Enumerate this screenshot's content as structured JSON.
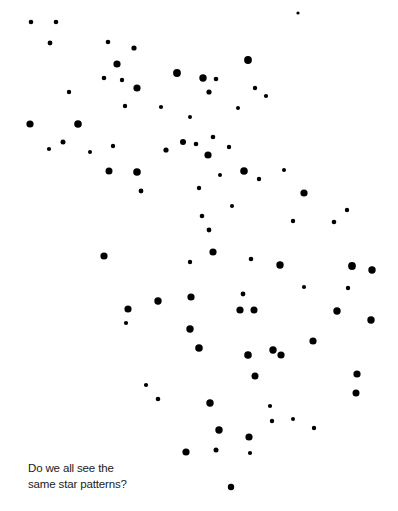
{
  "figure": {
    "background_color": "#ffffff",
    "star_color": "#000000",
    "width": 398,
    "height": 511
  },
  "caption": {
    "text": "Do we all see the\nsame star patterns?",
    "color": "#1b1b1b",
    "line1": "Do we all see the",
    "line2": "same star patterns?"
  },
  "chart_data": {
    "type": "scatter",
    "title": "",
    "subtitle": "",
    "xlabel": "",
    "ylabel": "",
    "annotations": [
      "Do we all see the same star patterns?"
    ],
    "grid": false,
    "legend": null,
    "axis_visible": false,
    "xlim": [
      0,
      398
    ],
    "ylim": [
      0,
      511
    ],
    "marker_color": "#000000",
    "marker_shape": "circle",
    "point_count": 88,
    "size_units": "radius_px",
    "points": [
      {
        "x": 31,
        "y": 22,
        "r": 2.3
      },
      {
        "x": 56,
        "y": 22,
        "r": 2.3
      },
      {
        "x": 50,
        "y": 43,
        "r": 2.4
      },
      {
        "x": 298,
        "y": 13,
        "r": 1.6
      },
      {
        "x": 108,
        "y": 42,
        "r": 2.3
      },
      {
        "x": 134,
        "y": 48,
        "r": 2.6
      },
      {
        "x": 117,
        "y": 64,
        "r": 3.6
      },
      {
        "x": 177,
        "y": 73,
        "r": 3.9
      },
      {
        "x": 104,
        "y": 78,
        "r": 2.3
      },
      {
        "x": 122,
        "y": 80,
        "r": 2.2
      },
      {
        "x": 137,
        "y": 88,
        "r": 3.6
      },
      {
        "x": 125,
        "y": 106,
        "r": 2.2
      },
      {
        "x": 248,
        "y": 60,
        "r": 3.9
      },
      {
        "x": 203,
        "y": 78,
        "r": 3.7
      },
      {
        "x": 216,
        "y": 79,
        "r": 2.3
      },
      {
        "x": 209,
        "y": 92,
        "r": 2.6
      },
      {
        "x": 255,
        "y": 88,
        "r": 2.2
      },
      {
        "x": 266,
        "y": 96,
        "r": 2.1
      },
      {
        "x": 69,
        "y": 92,
        "r": 2.2
      },
      {
        "x": 78,
        "y": 124,
        "r": 3.8
      },
      {
        "x": 30,
        "y": 124,
        "r": 3.6
      },
      {
        "x": 49,
        "y": 149,
        "r": 2.1
      },
      {
        "x": 63,
        "y": 142,
        "r": 2.5
      },
      {
        "x": 113,
        "y": 146,
        "r": 2.2
      },
      {
        "x": 109,
        "y": 171,
        "r": 3.5
      },
      {
        "x": 137,
        "y": 172,
        "r": 3.8
      },
      {
        "x": 141,
        "y": 191,
        "r": 2.4
      },
      {
        "x": 166,
        "y": 150,
        "r": 2.6
      },
      {
        "x": 183,
        "y": 142,
        "r": 3.0
      },
      {
        "x": 196,
        "y": 144,
        "r": 2.3
      },
      {
        "x": 208,
        "y": 155,
        "r": 3.6
      },
      {
        "x": 213,
        "y": 137,
        "r": 2.3
      },
      {
        "x": 229,
        "y": 147,
        "r": 2.2
      },
      {
        "x": 199,
        "y": 188,
        "r": 2.2
      },
      {
        "x": 220,
        "y": 175,
        "r": 2.0
      },
      {
        "x": 244,
        "y": 171,
        "r": 3.8
      },
      {
        "x": 259,
        "y": 179,
        "r": 2.2
      },
      {
        "x": 284,
        "y": 170,
        "r": 2.0
      },
      {
        "x": 304,
        "y": 193,
        "r": 3.6
      },
      {
        "x": 347,
        "y": 210,
        "r": 2.2
      },
      {
        "x": 293,
        "y": 221,
        "r": 2.2
      },
      {
        "x": 334,
        "y": 222,
        "r": 2.3
      },
      {
        "x": 202,
        "y": 216,
        "r": 2.3
      },
      {
        "x": 209,
        "y": 230,
        "r": 2.4
      },
      {
        "x": 213,
        "y": 252,
        "r": 3.6
      },
      {
        "x": 190,
        "y": 262,
        "r": 2.2
      },
      {
        "x": 251,
        "y": 259,
        "r": 2.3
      },
      {
        "x": 104,
        "y": 256,
        "r": 3.6
      },
      {
        "x": 280,
        "y": 265,
        "r": 3.7
      },
      {
        "x": 352,
        "y": 266,
        "r": 3.9
      },
      {
        "x": 372,
        "y": 270,
        "r": 3.7
      },
      {
        "x": 304,
        "y": 287,
        "r": 2.1
      },
      {
        "x": 348,
        "y": 288,
        "r": 2.2
      },
      {
        "x": 128,
        "y": 309,
        "r": 3.6
      },
      {
        "x": 158,
        "y": 301,
        "r": 3.7
      },
      {
        "x": 126,
        "y": 323,
        "r": 2.1
      },
      {
        "x": 191,
        "y": 297,
        "r": 3.6
      },
      {
        "x": 243,
        "y": 294,
        "r": 2.4
      },
      {
        "x": 240,
        "y": 310,
        "r": 3.6
      },
      {
        "x": 254,
        "y": 310,
        "r": 3.5
      },
      {
        "x": 190,
        "y": 329,
        "r": 3.7
      },
      {
        "x": 337,
        "y": 311,
        "r": 3.7
      },
      {
        "x": 371,
        "y": 320,
        "r": 3.7
      },
      {
        "x": 199,
        "y": 348,
        "r": 3.8
      },
      {
        "x": 248,
        "y": 355,
        "r": 3.8
      },
      {
        "x": 273,
        "y": 350,
        "r": 3.7
      },
      {
        "x": 281,
        "y": 355,
        "r": 3.6
      },
      {
        "x": 255,
        "y": 376,
        "r": 3.5
      },
      {
        "x": 313,
        "y": 341,
        "r": 3.6
      },
      {
        "x": 357,
        "y": 374,
        "r": 3.6
      },
      {
        "x": 356,
        "y": 393,
        "r": 3.5
      },
      {
        "x": 146,
        "y": 385,
        "r": 2.1
      },
      {
        "x": 158,
        "y": 399,
        "r": 2.3
      },
      {
        "x": 210,
        "y": 403,
        "r": 3.7
      },
      {
        "x": 270,
        "y": 406,
        "r": 2.1
      },
      {
        "x": 272,
        "y": 421,
        "r": 2.2
      },
      {
        "x": 293,
        "y": 419,
        "r": 2.0
      },
      {
        "x": 249,
        "y": 437,
        "r": 3.6
      },
      {
        "x": 314,
        "y": 428,
        "r": 2.2
      },
      {
        "x": 219,
        "y": 430,
        "r": 3.7
      },
      {
        "x": 250,
        "y": 453,
        "r": 2.1
      },
      {
        "x": 186,
        "y": 452,
        "r": 3.6
      },
      {
        "x": 216,
        "y": 450,
        "r": 2.5
      },
      {
        "x": 231,
        "y": 487,
        "r": 3.2
      },
      {
        "x": 190,
        "y": 117,
        "r": 2.0
      },
      {
        "x": 238,
        "y": 108,
        "r": 2.0
      },
      {
        "x": 161,
        "y": 107,
        "r": 2.1
      },
      {
        "x": 90,
        "y": 152,
        "r": 2.0
      },
      {
        "x": 232,
        "y": 206,
        "r": 2.0
      }
    ]
  }
}
